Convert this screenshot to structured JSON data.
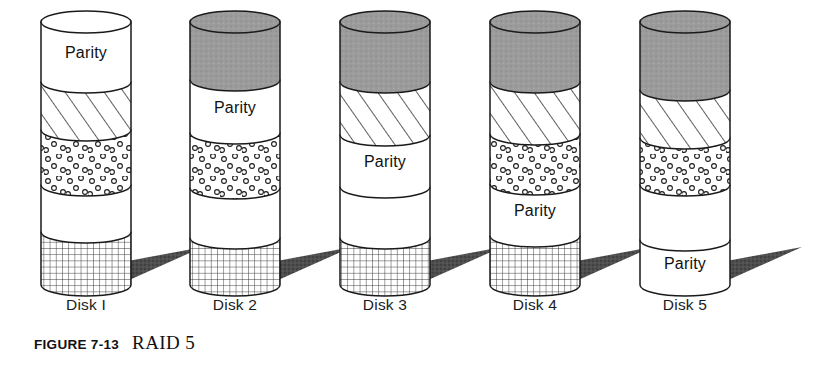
{
  "figure": {
    "caption_number": "FIGURE 7-13",
    "caption_title": "RAID 5",
    "parity_label": "Parity",
    "colors": {
      "stroke": "#1a1a1a",
      "gray_fill": "#9b9b9b",
      "white_fill": "#ffffff",
      "shadow": "#4a4a4a",
      "text": "#121212"
    },
    "geometry": {
      "cylinder_width": 90,
      "cylinder_top": 22,
      "cylinder_bottom": 285,
      "ellipse_ry": 11
    }
  },
  "disks": [
    {
      "label": "Disk I",
      "center_x": 86,
      "left_x": 41,
      "bands": [
        {
          "name": "parity-band",
          "fill": "white",
          "text": "Parity",
          "top": 22,
          "bottom": 82
        },
        {
          "name": "hatch-band",
          "fill": "hatch",
          "text": "",
          "top": 82,
          "bottom": 130
        },
        {
          "name": "dots-band",
          "fill": "dots",
          "text": "",
          "top": 130,
          "bottom": 185
        },
        {
          "name": "blank-band",
          "fill": "white",
          "text": "",
          "top": 185,
          "bottom": 232
        },
        {
          "name": "grid-band",
          "fill": "grid",
          "text": "",
          "top": 232,
          "bottom": 285
        }
      ]
    },
    {
      "label": "Disk 2",
      "center_x": 235,
      "left_x": 190,
      "bands": [
        {
          "name": "gray-band",
          "fill": "gray",
          "text": "",
          "top": 22,
          "bottom": 80
        },
        {
          "name": "parity-band",
          "fill": "white",
          "text": "Parity",
          "top": 80,
          "bottom": 133
        },
        {
          "name": "dots-band",
          "fill": "dots",
          "text": "",
          "top": 133,
          "bottom": 188
        },
        {
          "name": "blank-band",
          "fill": "white",
          "text": "",
          "top": 188,
          "bottom": 238
        },
        {
          "name": "grid-band",
          "fill": "grid",
          "text": "",
          "top": 238,
          "bottom": 285
        }
      ]
    },
    {
      "label": "Disk 3",
      "center_x": 385,
      "left_x": 340,
      "bands": [
        {
          "name": "gray-band",
          "fill": "gray",
          "text": "",
          "top": 22,
          "bottom": 82
        },
        {
          "name": "hatch-band",
          "fill": "hatch",
          "text": "",
          "top": 82,
          "bottom": 135
        },
        {
          "name": "parity-band",
          "fill": "white",
          "text": "Parity",
          "top": 135,
          "bottom": 187
        },
        {
          "name": "blank-band",
          "fill": "white",
          "text": "",
          "top": 187,
          "bottom": 238
        },
        {
          "name": "grid-band",
          "fill": "grid",
          "text": "",
          "top": 238,
          "bottom": 285
        }
      ]
    },
    {
      "label": "Disk 4",
      "center_x": 535,
      "left_x": 490,
      "bands": [
        {
          "name": "gray-band",
          "fill": "gray",
          "text": "",
          "top": 22,
          "bottom": 82
        },
        {
          "name": "hatch-band",
          "fill": "hatch",
          "text": "",
          "top": 82,
          "bottom": 134
        },
        {
          "name": "dots-band",
          "fill": "dots",
          "text": "",
          "top": 134,
          "bottom": 184
        },
        {
          "name": "parity-band",
          "fill": "white",
          "text": "Parity",
          "top": 184,
          "bottom": 236
        },
        {
          "name": "grid-band",
          "fill": "grid",
          "text": "",
          "top": 236,
          "bottom": 285
        }
      ]
    },
    {
      "label": "Disk 5",
      "center_x": 685,
      "left_x": 640,
      "bands": [
        {
          "name": "gray-band",
          "fill": "gray",
          "text": "",
          "top": 22,
          "bottom": 90
        },
        {
          "name": "hatch-band",
          "fill": "hatch",
          "text": "",
          "top": 90,
          "bottom": 138
        },
        {
          "name": "dots-band",
          "fill": "dots",
          "text": "",
          "top": 138,
          "bottom": 185
        },
        {
          "name": "blank-band",
          "fill": "white",
          "text": "",
          "top": 185,
          "bottom": 240
        },
        {
          "name": "parity-band",
          "fill": "white",
          "text": "Parity",
          "top": 240,
          "bottom": 285
        }
      ]
    }
  ],
  "labels_row": {
    "top": 296
  }
}
